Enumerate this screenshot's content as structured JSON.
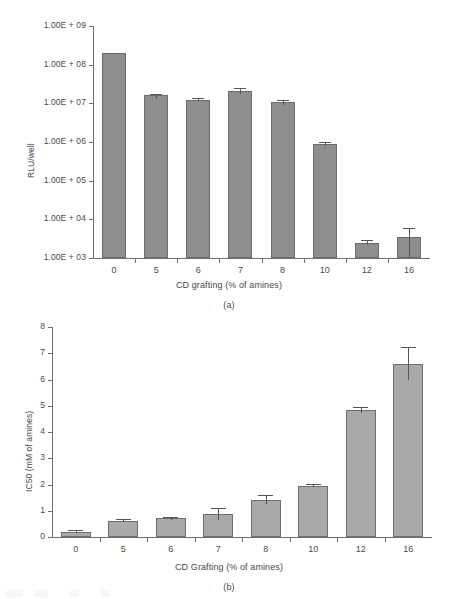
{
  "figure": {
    "panel_a_caption": "(a)",
    "panel_b_caption": "(b)"
  },
  "chart_data": [
    {
      "id": "panel-a",
      "type": "bar",
      "title": "",
      "xlabel": "CD grafting (% of amines)",
      "ylabel": "RLU/well",
      "categories": [
        "0",
        "5",
        "6",
        "7",
        "8",
        "10",
        "12",
        "16"
      ],
      "values": [
        200000000.0,
        16000000.0,
        12500000.0,
        21000000.0,
        11000000.0,
        900000.0,
        2500.0,
        3500.0
      ],
      "errors_upper": [
        0,
        1800000.0,
        1000000.0,
        4000000.0,
        1500000.0,
        100000.0,
        400.0,
        2600.0
      ],
      "errors_lower": [
        0,
        1800000.0,
        1000000.0,
        4000000.0,
        1500000.0,
        100000.0,
        400.0,
        2600.0
      ],
      "yscale": "log",
      "ylim": [
        1000,
        1000000000
      ],
      "ytick_labels": [
        "1.00E + 09",
        "1.00E + 08",
        "1.00E + 07",
        "1.00E + 06",
        "1.00E + 05",
        "1.00E + 04",
        "1.00E + 03"
      ],
      "ytick_values": [
        1000000000,
        100000000,
        10000000,
        1000000,
        100000,
        10000,
        1000
      ],
      "grid": false,
      "legend": "none",
      "bar_color": "#8e8e8e",
      "bar_edge_color": "#6c6c6c"
    },
    {
      "id": "panel-b",
      "type": "bar",
      "title": "",
      "xlabel": "CD Grafting (% of amines)",
      "ylabel": "IC50 (mM of amines)",
      "categories": [
        "0",
        "5",
        "6",
        "7",
        "8",
        "10",
        "12",
        "16"
      ],
      "values": [
        0.2,
        0.62,
        0.72,
        0.88,
        1.42,
        1.95,
        4.82,
        6.6
      ],
      "errors_upper": [
        0.05,
        0.05,
        0.05,
        0.22,
        0.18,
        0.06,
        0.12,
        0.62
      ],
      "errors_lower": [
        0.05,
        0.05,
        0.05,
        0.22,
        0.18,
        0.06,
        0.12,
        0.62
      ],
      "yscale": "linear",
      "ylim": [
        0,
        8
      ],
      "ytick_labels": [
        "8",
        "7",
        "6",
        "5",
        "4",
        "3",
        "2",
        "1",
        "0"
      ],
      "ytick_values": [
        8,
        7,
        6,
        5,
        4,
        3,
        2,
        1,
        0
      ],
      "grid": false,
      "legend": "none",
      "bar_color": "#a9a9a9",
      "bar_edge_color": "#6f6f6f"
    }
  ]
}
